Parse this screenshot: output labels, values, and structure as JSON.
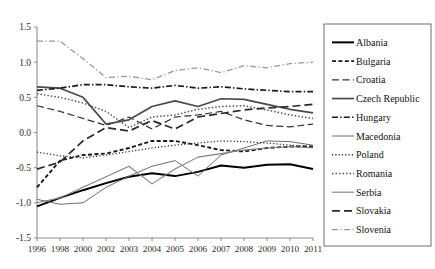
{
  "chart_data": {
    "type": "line",
    "title": "",
    "xlabel": "",
    "ylabel": "",
    "ylim": [
      -1.5,
      1.5
    ],
    "yticks": [
      "1.5",
      "1.0",
      "0.5",
      "0.0",
      "-0.5",
      "-1.0",
      "-1.5"
    ],
    "ytick_values": [
      1.5,
      1.0,
      0.5,
      0.0,
      -0.5,
      -1.0,
      -1.5
    ],
    "grid": false,
    "legend_position": "right",
    "x": [
      "1996",
      "1998",
      "2000",
      "2002",
      "2003",
      "2004",
      "2005",
      "2006",
      "2007",
      "2008",
      "2009",
      "2010",
      "2011"
    ],
    "series": [
      {
        "name": "Albania",
        "style": "solid-thick",
        "color": "#000000",
        "values": [
          -1.05,
          -0.93,
          -0.82,
          -0.72,
          -0.63,
          -0.58,
          -0.62,
          -0.56,
          -0.47,
          -0.5,
          -0.46,
          -0.45,
          -0.52
        ]
      },
      {
        "name": "Bulgaria",
        "style": "dashed-short-thick",
        "color": "#1a1a1a",
        "values": [
          -0.78,
          -0.4,
          -0.32,
          -0.3,
          -0.22,
          -0.12,
          -0.12,
          -0.18,
          -0.25,
          -0.27,
          -0.22,
          -0.2,
          -0.2
        ]
      },
      {
        "name": "Croatia",
        "style": "dashed-long",
        "color": "#333333",
        "values": [
          0.38,
          0.3,
          0.2,
          0.1,
          0.22,
          0.05,
          0.22,
          0.25,
          0.3,
          0.18,
          0.1,
          0.08,
          0.12
        ]
      },
      {
        "name": "Czech Republic",
        "style": "solid-medium",
        "color": "#4a4a4a",
        "values": [
          0.65,
          0.63,
          0.5,
          0.12,
          0.18,
          0.37,
          0.45,
          0.37,
          0.48,
          0.47,
          0.4,
          0.33,
          0.28
        ]
      },
      {
        "name": "Hungary",
        "style": "dash-dot-thick",
        "color": "#1a1a1a",
        "values": [
          0.6,
          0.63,
          0.68,
          0.68,
          0.65,
          0.63,
          0.67,
          0.63,
          0.65,
          0.62,
          0.6,
          0.58,
          0.58
        ]
      },
      {
        "name": "Macedonia",
        "style": "solid-thin",
        "color": "#6e6e6e",
        "values": [
          -0.95,
          -1.02,
          -1.0,
          -0.78,
          -0.62,
          -0.48,
          -0.4,
          -0.62,
          -0.32,
          -0.22,
          -0.12,
          -0.13,
          -0.18
        ]
      },
      {
        "name": "Poland",
        "style": "dotted-fine",
        "color": "#2f2f2f",
        "values": [
          -0.28,
          -0.33,
          -0.36,
          -0.32,
          -0.27,
          -0.22,
          -0.18,
          -0.15,
          -0.12,
          -0.13,
          -0.15,
          -0.18,
          -0.2
        ]
      },
      {
        "name": "Romania",
        "style": "dotted-medium",
        "color": "#555555",
        "values": [
          0.55,
          0.5,
          0.42,
          0.3,
          0.07,
          0.22,
          0.25,
          0.33,
          0.37,
          0.38,
          0.32,
          0.25,
          0.2
        ]
      },
      {
        "name": "Serbia",
        "style": "solid-thin-gray",
        "color": "#808080",
        "values": [
          -1.0,
          -0.93,
          -0.78,
          -0.63,
          -0.48,
          -0.73,
          -0.52,
          -0.35,
          -0.3,
          -0.25,
          -0.22,
          -0.2,
          -0.22
        ]
      },
      {
        "name": "Slovakia",
        "style": "dashed-long-thick",
        "color": "#2a2a2a",
        "values": [
          -0.52,
          -0.42,
          -0.12,
          0.07,
          0.02,
          0.17,
          0.05,
          0.22,
          0.27,
          0.32,
          0.35,
          0.37,
          0.4
        ]
      },
      {
        "name": "Slovenia",
        "style": "dash-dot-gray",
        "color": "#9a9a9a",
        "values": [
          1.3,
          1.3,
          1.05,
          0.78,
          0.8,
          0.75,
          0.88,
          0.92,
          0.85,
          0.95,
          0.92,
          0.98,
          1.0
        ]
      }
    ]
  },
  "axes": {
    "y_min_label": "-1.5",
    "y_max_label": "1.5"
  }
}
